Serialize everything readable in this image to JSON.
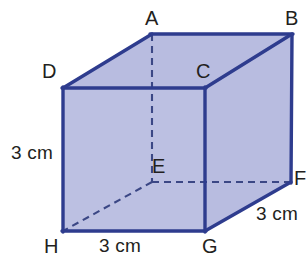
{
  "figure": {
    "type": "3d-cuboid-diagram",
    "colors": {
      "face_fill": "#b8bce0",
      "edge_stroke": "#2e3c8e",
      "hidden_edge_stroke": "#3b4785",
      "label_text": "#231f20",
      "background": "#ffffff"
    },
    "vertex_labels": [
      {
        "id": "A",
        "text": "A",
        "x": 145,
        "y": 8
      },
      {
        "id": "B",
        "text": "B",
        "x": 285,
        "y": 8
      },
      {
        "id": "C",
        "text": "C",
        "x": 196,
        "y": 61
      },
      {
        "id": "D",
        "text": "D",
        "x": 42,
        "y": 61
      },
      {
        "id": "E",
        "text": "E",
        "x": 152,
        "y": 156
      },
      {
        "id": "F",
        "text": "F",
        "x": 294,
        "y": 168
      },
      {
        "id": "G",
        "text": "G",
        "x": 202,
        "y": 236
      },
      {
        "id": "H",
        "text": "H",
        "x": 44,
        "y": 236
      }
    ],
    "dimension_labels": [
      {
        "id": "height-left",
        "text": "3 cm",
        "x": 11,
        "y": 143
      },
      {
        "id": "depth-right",
        "text": "3 cm",
        "x": 256,
        "y": 204
      },
      {
        "id": "width-bottom",
        "text": "3 cm",
        "x": 99,
        "y": 236
      }
    ],
    "geometry": {
      "points": {
        "A": [
          152,
          34
        ],
        "B": [
          292,
          34
        ],
        "C": [
          205,
          88
        ],
        "D": [
          63,
          88
        ],
        "E": [
          152,
          182
        ],
        "F": [
          291,
          182
        ],
        "G": [
          205,
          231
        ],
        "H": [
          63,
          231
        ]
      },
      "front_face": "D,C,G,H",
      "top_face": "A,B,C,D",
      "right_face": "C,B,F,G",
      "solid_edges": [
        "A-B",
        "B-C",
        "C-D",
        "D-A",
        "D-H",
        "C-G",
        "B-F",
        "H-G",
        "G-F"
      ],
      "hidden_edges": [
        "A-E",
        "E-F",
        "E-H"
      ]
    }
  }
}
